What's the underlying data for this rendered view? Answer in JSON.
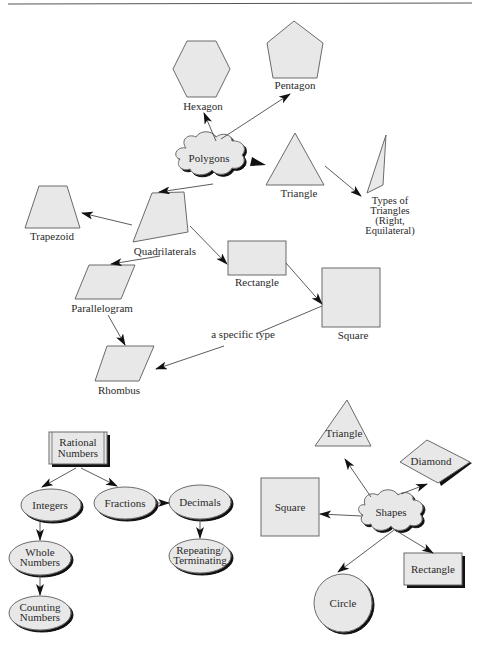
{
  "header_rule": true,
  "diagram_polygons": {
    "root": "Polygons",
    "nodes": {
      "hexagon": "Hexagon",
      "pentagon": "Pentagon",
      "triangle": "Triangle",
      "types_of_triangles": [
        "Types of",
        "Triangles",
        "(Right,",
        "Equilateral)"
      ],
      "trapezoid": "Trapezoid",
      "quadrilaterals": "Quadrilaterals",
      "rectangle": "Rectangle",
      "square": "Square",
      "parallelogram": "Parallelogram",
      "rhombus": "Rhombus"
    },
    "edge_labels": {
      "square_to_rhombus": "a specific type"
    }
  },
  "diagram_rational_numbers": {
    "root": [
      "Rational",
      "Numbers"
    ],
    "nodes": {
      "integers": "Integers",
      "fractions": "Fractions",
      "decimals": "Decimals",
      "whole_numbers": [
        "Whole",
        "Numbers"
      ],
      "counting_numbers": [
        "Counting",
        "Numbers"
      ],
      "repeating_terminating": [
        "Repeating/",
        "Terminating"
      ]
    }
  },
  "diagram_shapes": {
    "root": "Shapes",
    "nodes": {
      "triangle": "Triangle",
      "diamond": "Diamond",
      "square": "Square",
      "rectangle": "Rectangle",
      "circle": "Circle"
    }
  }
}
